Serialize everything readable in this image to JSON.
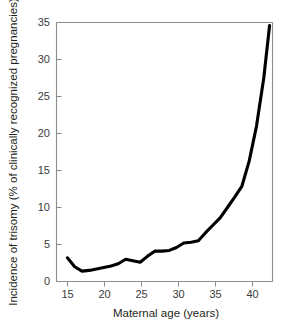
{
  "chart_data": {
    "type": "line",
    "title": "",
    "subtitle": "",
    "xlabel": "Maternal age (years)",
    "ylabel": "Incidence of trisomy (% of clinically recognized pregnancies)",
    "xlim": [
      13.5,
      43.2
    ],
    "ylim": [
      0,
      35
    ],
    "xticks": [
      15,
      20,
      25,
      30,
      35,
      40
    ],
    "xtick_labels": [
      "15",
      "20",
      "25",
      "30",
      "35",
      "40"
    ],
    "yticks": [
      0,
      5,
      10,
      15,
      20,
      25,
      30,
      35
    ],
    "ytick_labels": [
      "0",
      "5",
      "10",
      "15",
      "20",
      "25",
      "30",
      "35"
    ],
    "grid": false,
    "legend": false,
    "legend_position": "none",
    "series": [
      {
        "name": "Incidence of trisomy",
        "color": "#000000",
        "x": [
          15,
          16,
          17,
          18,
          19,
          20,
          21,
          22,
          23,
          24,
          25,
          26,
          27,
          28,
          29,
          30,
          31,
          32,
          33,
          34,
          35,
          36,
          37,
          38,
          39,
          40,
          41,
          42,
          42.8
        ],
        "values": [
          3.2,
          2.0,
          1.4,
          1.5,
          1.7,
          1.9,
          2.1,
          2.4,
          3.0,
          2.8,
          2.6,
          3.4,
          4.1,
          4.1,
          4.2,
          4.6,
          5.2,
          5.3,
          5.5,
          6.6,
          7.6,
          8.6,
          10.0,
          11.4,
          12.9,
          16.3,
          21.0,
          27.5,
          34.6
        ]
      }
    ],
    "axis_color": "#8d8d8d",
    "background": "#ffffff"
  },
  "figure": {
    "x_axis_title": "Maternal age (years)",
    "y_axis_title": "Incidence of trisomy (% of clinically recognized pregnancies)"
  }
}
